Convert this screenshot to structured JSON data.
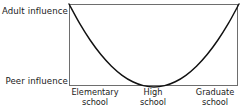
{
  "chart_data": {
    "type": "line",
    "title": "",
    "xlabel": "",
    "ylabel": "",
    "grid": false,
    "legend": null,
    "axis_endpoint_labels": {
      "y_top": "Adult influence",
      "y_bottom": "Peer influence"
    },
    "categories": [
      "Elementary school",
      "High school",
      "Graduate school"
    ],
    "tick_labels": [
      {
        "line1": "Elementary",
        "line2": "school"
      },
      {
        "line1": "High",
        "line2": "school"
      },
      {
        "line1": "Graduate",
        "line2": "school"
      }
    ],
    "ylim": [
      0,
      1
    ],
    "ytick_labels": [
      "Peer influence",
      "Adult influence"
    ],
    "series": [
      {
        "name": "Influence",
        "x": [
          0,
          0.0625,
          0.125,
          0.1875,
          0.25,
          0.3125,
          0.375,
          0.4375,
          0.5,
          0.5625,
          0.625,
          0.6875,
          0.75,
          0.8125,
          0.875,
          0.9375,
          1
        ],
        "values": [
          1,
          0.766,
          0.563,
          0.391,
          0.25,
          0.141,
          0.063,
          0.016,
          0,
          0.016,
          0.063,
          0.141,
          0.25,
          0.391,
          0.563,
          0.766,
          1
        ]
      }
    ],
    "annotations": [],
    "colors": {
      "curve": "#111111",
      "frame": "#6e6e6e",
      "text": "#1a1a1a",
      "background": "#ffffff"
    }
  }
}
